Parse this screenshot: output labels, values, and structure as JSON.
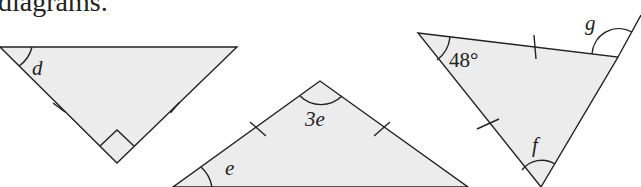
{
  "caption": "diagrams.",
  "triangles": [
    {
      "id": "t1",
      "angle_labels": [
        "d"
      ],
      "marks": "two equal sides, right angle"
    },
    {
      "id": "t2",
      "angle_labels": [
        "3e",
        "e"
      ],
      "marks": "two equal sides"
    },
    {
      "id": "t3",
      "angle_labels": [
        "48°",
        "f",
        "g"
      ],
      "marks": "two equal sides, exterior angle g"
    }
  ],
  "labels": {
    "d": "d",
    "three_e": "3e",
    "e": "e",
    "forty_eight": "48°",
    "f": "f",
    "g": "g"
  },
  "colors": {
    "fill": "#ececec",
    "stroke": "#222222"
  }
}
